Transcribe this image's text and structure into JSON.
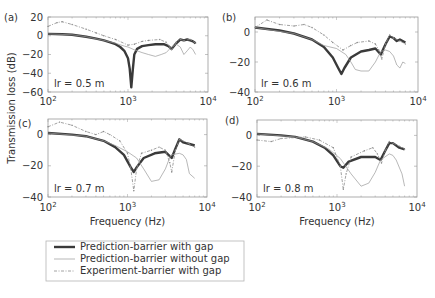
{
  "figure": {
    "ylabel": "Transmission loss (dB)",
    "xlabel": "Frequency (Hz)",
    "colors": {
      "thick": "#3a3a3a",
      "thin": "#9a9a9a",
      "dashed": "#8a8a8a",
      "frame": "#9a9a9a",
      "text": "#333333"
    }
  },
  "legend": {
    "items": [
      {
        "label": "Prediction-barrier with gap",
        "style": "thick"
      },
      {
        "label": "Prediction-barrier without gap",
        "style": "thin"
      },
      {
        "label": "Experiment-barrier with gap",
        "style": "dashed"
      }
    ]
  },
  "chart_data": [
    {
      "type": "line",
      "panel": "(a)",
      "annotation": "lr = 0.5 m",
      "xscale": "log",
      "xlim": [
        100,
        10000
      ],
      "xticks": [
        "10^2",
        "10^3",
        "10^4"
      ],
      "ylim": [
        -60,
        20
      ],
      "yticks": [
        20,
        0,
        -20,
        -40,
        -60
      ],
      "xlabel": "",
      "ylabel": "Transmission loss (dB)",
      "series": [
        {
          "name": "Prediction-barrier with gap",
          "style": "thick",
          "points": [
            [
              100,
              2
            ],
            [
              150,
              1.5
            ],
            [
              200,
              1
            ],
            [
              300,
              -1
            ],
            [
              400,
              -3
            ],
            [
              500,
              -5
            ],
            [
              600,
              -7
            ],
            [
              700,
              -9
            ],
            [
              800,
              -12
            ],
            [
              900,
              -16
            ],
            [
              1000,
              -24
            ],
            [
              1050,
              -35
            ],
            [
              1100,
              -55
            ],
            [
              1150,
              -35
            ],
            [
              1200,
              -20
            ],
            [
              1300,
              -14
            ],
            [
              1500,
              -11
            ],
            [
              1800,
              -10
            ],
            [
              2200,
              -9
            ],
            [
              2800,
              -9
            ],
            [
              3200,
              -11
            ],
            [
              3500,
              -14
            ],
            [
              4000,
              -8
            ],
            [
              4500,
              -4
            ],
            [
              5000,
              -5
            ],
            [
              5500,
              -4
            ],
            [
              6000,
              -5
            ],
            [
              6500,
              -6
            ],
            [
              7000,
              -8
            ]
          ]
        },
        {
          "name": "Prediction-barrier without gap",
          "style": "thin",
          "points": [
            [
              100,
              2
            ],
            [
              200,
              1
            ],
            [
              300,
              -1
            ],
            [
              500,
              -5
            ],
            [
              700,
              -8
            ],
            [
              900,
              -11
            ],
            [
              1000,
              -12
            ],
            [
              1200,
              -15
            ],
            [
              1500,
              -18
            ],
            [
              1800,
              -20
            ],
            [
              2200,
              -22
            ],
            [
              2600,
              -20
            ],
            [
              3000,
              -18
            ],
            [
              3500,
              -12
            ],
            [
              4000,
              -9
            ],
            [
              4500,
              -12
            ],
            [
              5000,
              -20
            ],
            [
              5500,
              -16
            ],
            [
              6000,
              -12
            ],
            [
              6500,
              -15
            ],
            [
              7000,
              -20
            ]
          ]
        },
        {
          "name": "Experiment-barrier with gap",
          "style": "dashed",
          "points": [
            [
              100,
              10
            ],
            [
              130,
              14
            ],
            [
              150,
              15
            ],
            [
              200,
              12
            ],
            [
              300,
              7
            ],
            [
              400,
              3
            ],
            [
              500,
              0
            ],
            [
              700,
              -4
            ],
            [
              1000,
              -10
            ],
            [
              1200,
              -9
            ],
            [
              1500,
              -6
            ],
            [
              1800,
              -5
            ],
            [
              2500,
              -4
            ],
            [
              3000,
              -7
            ],
            [
              3300,
              -12
            ],
            [
              3500,
              -15
            ],
            [
              4000,
              -7
            ],
            [
              4500,
              -4
            ],
            [
              5000,
              -5
            ],
            [
              6000,
              -4
            ],
            [
              7000,
              -8
            ]
          ]
        }
      ]
    },
    {
      "type": "line",
      "panel": "(b)",
      "annotation": "lr = 0.6 m",
      "xscale": "log",
      "xlim": [
        100,
        10000
      ],
      "xticks": [
        "10^2",
        "10^3",
        "10^4"
      ],
      "ylim": [
        -40,
        10
      ],
      "yticks": [
        0,
        -20,
        -40
      ],
      "xlabel": "",
      "ylabel": "",
      "series": [
        {
          "name": "Prediction-barrier with gap",
          "style": "thick",
          "points": [
            [
              100,
              3
            ],
            [
              200,
              1
            ],
            [
              300,
              -1
            ],
            [
              500,
              -5
            ],
            [
              700,
              -10
            ],
            [
              900,
              -17
            ],
            [
              1050,
              -24
            ],
            [
              1150,
              -28
            ],
            [
              1250,
              -24
            ],
            [
              1500,
              -17
            ],
            [
              2000,
              -13
            ],
            [
              2500,
              -12
            ],
            [
              3000,
              -11
            ],
            [
              3500,
              -15
            ],
            [
              4000,
              -8
            ],
            [
              4500,
              -3
            ],
            [
              5000,
              -4
            ],
            [
              5500,
              -6
            ],
            [
              6000,
              -5
            ],
            [
              7000,
              -7
            ]
          ]
        },
        {
          "name": "Prediction-barrier without gap",
          "style": "thin",
          "points": [
            [
              100,
              3
            ],
            [
              300,
              -1
            ],
            [
              500,
              -5
            ],
            [
              700,
              -9
            ],
            [
              1000,
              -11
            ],
            [
              1300,
              -15
            ],
            [
              1500,
              -20
            ],
            [
              1700,
              -25
            ],
            [
              2000,
              -26
            ],
            [
              2500,
              -26
            ],
            [
              3000,
              -20
            ],
            [
              3500,
              -13
            ],
            [
              4000,
              -12
            ],
            [
              4500,
              -13
            ],
            [
              5000,
              -16
            ],
            [
              5500,
              -22
            ],
            [
              6000,
              -24
            ],
            [
              6500,
              -20
            ],
            [
              7000,
              -21
            ]
          ]
        },
        {
          "name": "Experiment-barrier with gap",
          "style": "dashed",
          "points": [
            [
              100,
              3
            ],
            [
              140,
              8
            ],
            [
              200,
              5
            ],
            [
              300,
              4
            ],
            [
              400,
              5
            ],
            [
              500,
              3
            ],
            [
              700,
              -2
            ],
            [
              900,
              -7
            ],
            [
              1200,
              -12
            ],
            [
              1500,
              -9
            ],
            [
              1800,
              -7
            ],
            [
              2500,
              -6
            ],
            [
              3000,
              -8
            ],
            [
              3300,
              -12
            ],
            [
              3600,
              -18
            ],
            [
              4000,
              -8
            ],
            [
              4500,
              -2
            ],
            [
              5000,
              -4
            ],
            [
              6000,
              -6
            ],
            [
              7000,
              -8
            ]
          ]
        }
      ]
    },
    {
      "type": "line",
      "panel": "(c)",
      "annotation": "lr = 0.7 m",
      "xscale": "log",
      "xlim": [
        100,
        10000
      ],
      "xticks": [
        "10^2",
        "10^3",
        "10^4"
      ],
      "ylim": [
        -40,
        10
      ],
      "yticks": [
        0,
        -20,
        -40
      ],
      "xlabel": "Frequency (Hz)",
      "ylabel": "Transmission loss (dB)",
      "series": [
        {
          "name": "Prediction-barrier with gap",
          "style": "thick",
          "points": [
            [
              100,
              1
            ],
            [
              200,
              0
            ],
            [
              300,
              -1
            ],
            [
              500,
              -4
            ],
            [
              700,
              -8
            ],
            [
              900,
              -13
            ],
            [
              1100,
              -21
            ],
            [
              1200,
              -24
            ],
            [
              1300,
              -21
            ],
            [
              1600,
              -15
            ],
            [
              2200,
              -12
            ],
            [
              3000,
              -11
            ],
            [
              3600,
              -15
            ],
            [
              4000,
              -9
            ],
            [
              4500,
              -3
            ],
            [
              5000,
              -5
            ],
            [
              6000,
              -6
            ],
            [
              7000,
              -7
            ]
          ]
        },
        {
          "name": "Prediction-barrier without gap",
          "style": "thin",
          "points": [
            [
              100,
              1
            ],
            [
              300,
              -1
            ],
            [
              500,
              -4
            ],
            [
              700,
              -7
            ],
            [
              1000,
              -11
            ],
            [
              1300,
              -15
            ],
            [
              1600,
              -22
            ],
            [
              2000,
              -30
            ],
            [
              2500,
              -29
            ],
            [
              3000,
              -22
            ],
            [
              3500,
              -13
            ],
            [
              4500,
              -12
            ],
            [
              5000,
              -13
            ],
            [
              5500,
              -16
            ],
            [
              6000,
              -25
            ],
            [
              7000,
              -28
            ]
          ]
        },
        {
          "name": "Experiment-barrier with gap",
          "style": "dashed",
          "points": [
            [
              100,
              5
            ],
            [
              140,
              8
            ],
            [
              200,
              6
            ],
            [
              300,
              2
            ],
            [
              400,
              0
            ],
            [
              500,
              2
            ],
            [
              600,
              0
            ],
            [
              800,
              -4
            ],
            [
              1000,
              -12
            ],
            [
              1100,
              -22
            ],
            [
              1200,
              -36
            ],
            [
              1300,
              -22
            ],
            [
              1500,
              -12
            ],
            [
              2000,
              -10
            ],
            [
              2500,
              -8
            ],
            [
              3000,
              -10
            ],
            [
              3400,
              -18
            ],
            [
              3600,
              -24
            ],
            [
              4000,
              -10
            ],
            [
              4500,
              -3
            ],
            [
              5000,
              -4
            ],
            [
              6000,
              -6
            ],
            [
              7000,
              -8
            ]
          ]
        }
      ]
    },
    {
      "type": "line",
      "panel": "(d)",
      "annotation": "lr = 0.8 m",
      "xscale": "log",
      "xlim": [
        100,
        10000
      ],
      "xticks": [
        "10^2",
        "10^3",
        "10^4"
      ],
      "ylim": [
        -40,
        10
      ],
      "yticks": [
        0,
        -20,
        -40
      ],
      "xlabel": "Frequency (Hz)",
      "ylabel": "",
      "series": [
        {
          "name": "Prediction-barrier with gap",
          "style": "thick",
          "points": [
            [
              100,
              1
            ],
            [
              200,
              0
            ],
            [
              300,
              -1
            ],
            [
              500,
              -4
            ],
            [
              700,
              -8
            ],
            [
              900,
              -13
            ],
            [
              1100,
              -20
            ],
            [
              1200,
              -21
            ],
            [
              1400,
              -17
            ],
            [
              2000,
              -14
            ],
            [
              3000,
              -14
            ],
            [
              3500,
              -16
            ],
            [
              4000,
              -10
            ],
            [
              4500,
              -5
            ],
            [
              5000,
              -5
            ],
            [
              6000,
              -8
            ],
            [
              7000,
              -9
            ]
          ]
        },
        {
          "name": "Prediction-barrier without gap",
          "style": "thin",
          "points": [
            [
              100,
              1
            ],
            [
              300,
              -1
            ],
            [
              500,
              -4
            ],
            [
              800,
              -9
            ],
            [
              1100,
              -15
            ],
            [
              1500,
              -25
            ],
            [
              2000,
              -33
            ],
            [
              2500,
              -31
            ],
            [
              3000,
              -24
            ],
            [
              3500,
              -16
            ],
            [
              4500,
              -12
            ],
            [
              5000,
              -13
            ],
            [
              5500,
              -16
            ],
            [
              6500,
              -25
            ],
            [
              7000,
              -33
            ]
          ]
        },
        {
          "name": "Experiment-barrier with gap",
          "style": "dashed",
          "points": [
            [
              100,
              -3
            ],
            [
              150,
              -4
            ],
            [
              200,
              -2
            ],
            [
              400,
              -1
            ],
            [
              600,
              -3
            ],
            [
              900,
              -8
            ],
            [
              1100,
              -20
            ],
            [
              1200,
              -35
            ],
            [
              1300,
              -25
            ],
            [
              1500,
              -14
            ],
            [
              2200,
              -10
            ],
            [
              2800,
              -8
            ],
            [
              3200,
              -12
            ],
            [
              3600,
              -18
            ],
            [
              4000,
              -10
            ],
            [
              4500,
              -4
            ],
            [
              5000,
              -5
            ],
            [
              6000,
              -7
            ],
            [
              7000,
              -9
            ]
          ]
        }
      ]
    }
  ]
}
